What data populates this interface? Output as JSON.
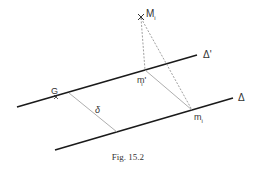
{
  "figure": {
    "caption": "Fig. 15.2",
    "labels": {
      "line_delta_prime": "Δ'",
      "line_delta": "Δ",
      "point_G": "G",
      "point_M": "M",
      "point_M_sub": "i",
      "point_m_prime": "m'",
      "point_m_prime_sub": "i",
      "point_m": "m",
      "point_m_sub": "i",
      "distance": "δ"
    },
    "colors": {
      "solid_line": "#1a1a1a",
      "dashed_line": "#888888",
      "text": "#333333"
    }
  }
}
